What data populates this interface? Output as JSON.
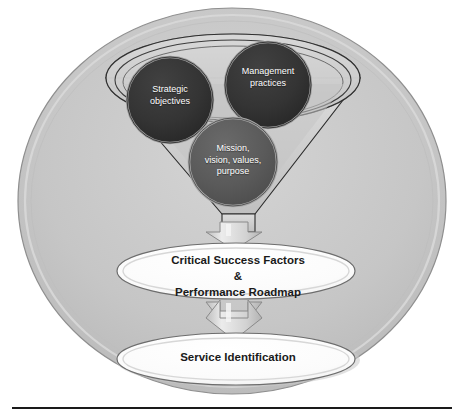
{
  "diagram": {
    "colors": {
      "outer_circle_fill": "#c8c8c8",
      "outer_circle_ring": "#d8d8d8",
      "outer_circle_stroke": "#8f8f8f",
      "funnel_fill": "#d0d0d0",
      "funnel_stroke": "#2b2b2b",
      "bubble_dark": "#333333",
      "bubble_mid": "#595959",
      "arrow_fill": "#cfcfcf",
      "arrow_stroke": "#8a8a8a",
      "oval_fill": "#ffffff",
      "oval_stroke": "#6d6d6d",
      "text_light": "#ffffff",
      "text_dark": "#1a1a1a",
      "rule_color": "#1a1a1a"
    },
    "funnel_inputs": [
      {
        "id": "strategic-objectives",
        "label": "Strategic\nobjectives",
        "line1": "Strategic",
        "line2": "objectives",
        "fill": "#333333"
      },
      {
        "id": "management-practices",
        "label": "Management\npractices",
        "line1": "Management",
        "line2": "practices",
        "fill": "#333333"
      },
      {
        "id": "mission-vision-values-purpose",
        "line1": "Mission,",
        "line2": "vision, values,",
        "line3": "purpose",
        "fill": "#595959"
      }
    ],
    "outputs": [
      {
        "id": "critical-success-factors",
        "line1": "Critical Success Factors",
        "line2": "&",
        "line3": "Performance Roadmap"
      },
      {
        "id": "service-identification",
        "line1": "Service Identification"
      }
    ],
    "connectors": [
      {
        "id": "arrow-funnel-to-csf",
        "direction": "down"
      },
      {
        "id": "arrow-csf-to-service",
        "direction": "down"
      }
    ]
  }
}
